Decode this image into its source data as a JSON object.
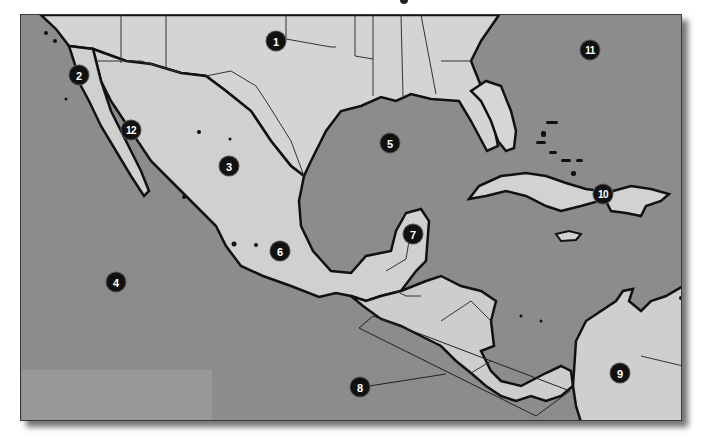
{
  "map": {
    "title_fragment": "g",
    "region": "Mexico, Central America and the Caribbean",
    "colors": {
      "water": "#8c8c8c",
      "land": "#d6d6d6",
      "land_relief": "#c4c4c4",
      "coastline": "#111111",
      "border": "#333333",
      "marker_bg": "#111111",
      "marker_text": "#ffffff"
    },
    "markers": [
      {
        "id": 1,
        "label": "1",
        "x": 276,
        "y": 41
      },
      {
        "id": 2,
        "label": "2",
        "x": 79,
        "y": 75
      },
      {
        "id": 3,
        "label": "3",
        "x": 229,
        "y": 166
      },
      {
        "id": 4,
        "label": "4",
        "x": 116,
        "y": 282
      },
      {
        "id": 5,
        "label": "5",
        "x": 390,
        "y": 143
      },
      {
        "id": 6,
        "label": "6",
        "x": 280,
        "y": 251
      },
      {
        "id": 7,
        "label": "7",
        "x": 413,
        "y": 234
      },
      {
        "id": 8,
        "label": "8",
        "x": 360,
        "y": 387
      },
      {
        "id": 9,
        "label": "9",
        "x": 620,
        "y": 373
      },
      {
        "id": 10,
        "label": "10",
        "x": 603,
        "y": 194
      },
      {
        "id": 11,
        "label": "11",
        "x": 590,
        "y": 50
      },
      {
        "id": 12,
        "label": "12",
        "x": 131,
        "y": 130
      }
    ],
    "legend_box": {
      "text": ""
    }
  }
}
